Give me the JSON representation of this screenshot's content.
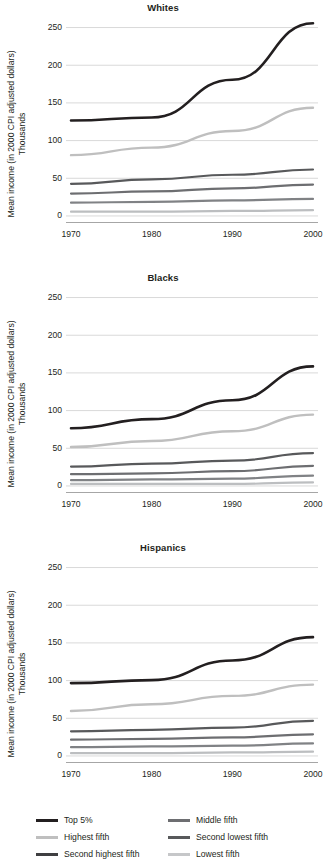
{
  "chart_data": [
    {
      "type": "line",
      "title": "Whites",
      "xlabel": "",
      "ylabel": "Mean income (in 2000 CPI adjusted dollars)",
      "ylabel_line2": "Thousands",
      "x": [
        1970,
        1980,
        1990,
        2000
      ],
      "xtick_labels": [
        "1970",
        "1980",
        "1990",
        "2000"
      ],
      "ytick_labels": [
        "0",
        "50",
        "100",
        "150",
        "200",
        "250"
      ],
      "yticks": [
        0,
        50,
        100,
        150,
        200,
        250
      ],
      "ylim": [
        -10,
        262
      ],
      "grid": "horizontal",
      "legend_position": "bottom",
      "series": [
        {
          "name": "Top 5%",
          "color": "#231f20",
          "width": 2.6,
          "values": [
            126,
            130,
            180,
            255
          ]
        },
        {
          "name": "Highest fifth",
          "color": "#bfbfbf",
          "width": 2.4,
          "values": [
            80,
            90,
            112,
            143
          ]
        },
        {
          "name": "Second highest fifth",
          "color": "#58595b",
          "width": 2.2,
          "values": [
            42,
            48,
            54,
            61
          ]
        },
        {
          "name": "Middle fifth",
          "color": "#6d6e71",
          "width": 2.2,
          "values": [
            29,
            32,
            36,
            41
          ]
        },
        {
          "name": "Second lowest fifth",
          "color": "#808285",
          "width": 2.2,
          "values": [
            17,
            18,
            20,
            22
          ]
        },
        {
          "name": "Lowest fifth",
          "color": "#bcbec0",
          "width": 2.2,
          "values": [
            5,
            5,
            6,
            7
          ]
        }
      ]
    },
    {
      "type": "line",
      "title": "Blacks",
      "xlabel": "",
      "ylabel": "Mean income (in 2000 CPI adjusted dollars)",
      "ylabel_line2": "Thousands",
      "x": [
        1970,
        1980,
        1990,
        2000
      ],
      "xtick_labels": [
        "1970",
        "1980",
        "1990",
        "2000"
      ],
      "ytick_labels": [
        "0",
        "50",
        "100",
        "150",
        "200",
        "250"
      ],
      "yticks": [
        0,
        50,
        100,
        150,
        200,
        250
      ],
      "ylim": [
        -10,
        262
      ],
      "grid": "horizontal",
      "legend_position": "bottom",
      "series": [
        {
          "name": "Top 5%",
          "color": "#231f20",
          "width": 2.6,
          "values": [
            76,
            88,
            113,
            158
          ]
        },
        {
          "name": "Highest fifth",
          "color": "#bfbfbf",
          "width": 2.4,
          "values": [
            51,
            59,
            72,
            94
          ]
        },
        {
          "name": "Second highest fifth",
          "color": "#58595b",
          "width": 2.2,
          "values": [
            25,
            29,
            33,
            43
          ]
        },
        {
          "name": "Middle fifth",
          "color": "#6d6e71",
          "width": 2.2,
          "values": [
            15,
            16,
            19,
            26
          ]
        },
        {
          "name": "Second lowest fifth",
          "color": "#808285",
          "width": 2.2,
          "values": [
            7,
            8,
            9,
            13
          ]
        },
        {
          "name": "Lowest fifth",
          "color": "#bcbec0",
          "width": 2.2,
          "values": [
            2,
            2,
            2,
            4
          ]
        }
      ]
    },
    {
      "type": "line",
      "title": "Hispanics",
      "xlabel": "",
      "ylabel": "Mean income (in 2000 CPI adjusted dollars)",
      "ylabel_line2": "Thousands",
      "x": [
        1970,
        1980,
        1990,
        2000
      ],
      "xtick_labels": [
        "1970",
        "1980",
        "1990",
        "2000"
      ],
      "ytick_labels": [
        "0",
        "50",
        "100",
        "150",
        "200",
        "250"
      ],
      "yticks": [
        0,
        50,
        100,
        150,
        200,
        250
      ],
      "ylim": [
        -10,
        262
      ],
      "grid": "horizontal",
      "legend_position": "bottom",
      "series": [
        {
          "name": "Top 5%",
          "color": "#231f20",
          "width": 2.6,
          "values": [
            96,
            100,
            126,
            157
          ]
        },
        {
          "name": "Highest fifth",
          "color": "#bfbfbf",
          "width": 2.4,
          "values": [
            59,
            68,
            79,
            94
          ]
        },
        {
          "name": "Second highest fifth",
          "color": "#58595b",
          "width": 2.2,
          "values": [
            32,
            34,
            37,
            46
          ]
        },
        {
          "name": "Middle fifth",
          "color": "#6d6e71",
          "width": 2.2,
          "values": [
            21,
            22,
            24,
            28
          ]
        },
        {
          "name": "Second lowest fifth",
          "color": "#808285",
          "width": 2.2,
          "values": [
            11,
            12,
            13,
            16
          ]
        },
        {
          "name": "Lowest fifth",
          "color": "#bcbec0",
          "width": 2.2,
          "values": [
            3,
            3,
            4,
            5
          ]
        }
      ]
    }
  ],
  "legend": {
    "entries": [
      {
        "label": "Top 5%",
        "color": "#231f20"
      },
      {
        "label": "Middle fifth",
        "color": "#6d6e71"
      },
      {
        "label": "Highest fifth",
        "color": "#bfbfbf"
      },
      {
        "label": "Second lowest fifth",
        "color": "#58595b"
      },
      {
        "label": "Second highest fifth",
        "color": "#3f3f41"
      },
      {
        "label": "Lowest fifth",
        "color": "#c6c7c9"
      }
    ]
  },
  "style": {
    "grid_color": "#d9d9d9",
    "axis_color": "#a6a6a6",
    "text_color": "#231f20",
    "background": "#ffffff"
  }
}
